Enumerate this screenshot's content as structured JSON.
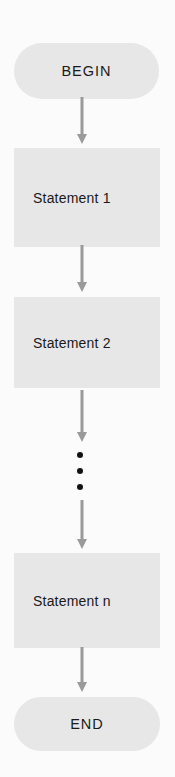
{
  "diagram": {
    "type": "flowchart",
    "direction": "top-to-bottom",
    "colors": {
      "background": "#fbfbfb",
      "node_fill": "#e7e7e7",
      "arrow": "#9a9a9a",
      "text": "#1a1a1a",
      "ellipsis_dots": "#111111"
    },
    "nodes": [
      {
        "id": "begin",
        "shape": "terminal",
        "label": "BEGIN"
      },
      {
        "id": "s1",
        "shape": "process",
        "label": "Statement 1"
      },
      {
        "id": "s2",
        "shape": "process",
        "label": "Statement 2"
      },
      {
        "id": "ellipsis",
        "shape": "vertical-ellipsis",
        "label": "⋮"
      },
      {
        "id": "sn",
        "shape": "process",
        "label": "Statement n"
      },
      {
        "id": "end",
        "shape": "terminal",
        "label": "END"
      }
    ],
    "edges": [
      {
        "from": "begin",
        "to": "s1"
      },
      {
        "from": "s1",
        "to": "s2"
      },
      {
        "from": "s2",
        "to": "ellipsis"
      },
      {
        "from": "ellipsis",
        "to": "sn"
      },
      {
        "from": "sn",
        "to": "end"
      }
    ]
  }
}
